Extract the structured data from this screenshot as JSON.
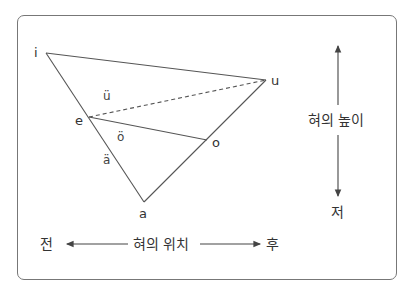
{
  "diagram": {
    "title": "",
    "vowels": {
      "i": "i",
      "u": "u",
      "e": "e",
      "o": "o",
      "a": "a",
      "u_umlaut": "ü",
      "o_umlaut": "ö",
      "a_umlaut": "ä"
    },
    "vertical_axis": {
      "label": "혀의 높이",
      "bottom": "저"
    },
    "horizontal_axis": {
      "label": "혀의 위치",
      "left": "전",
      "right": "후"
    },
    "colors": {
      "line": "#555555",
      "border": "#777777",
      "text": "#333333"
    }
  }
}
